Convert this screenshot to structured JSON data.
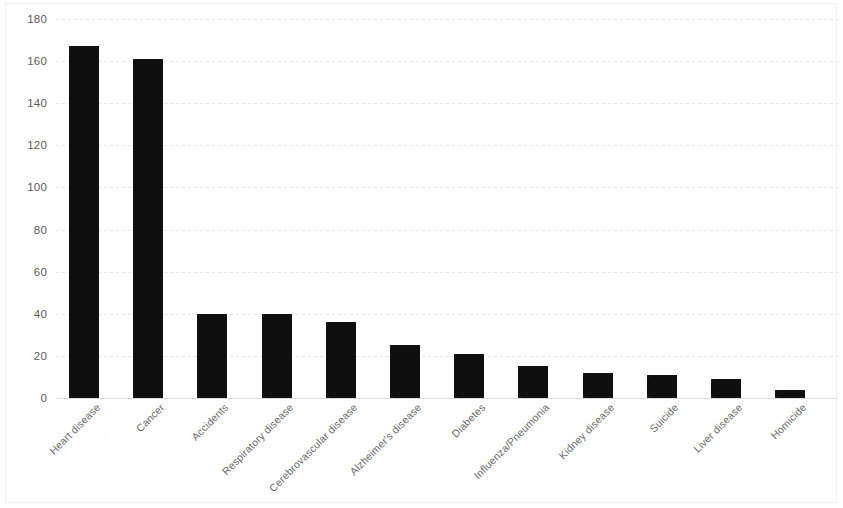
{
  "chart_data": {
    "type": "bar",
    "title": "",
    "subtitle": "",
    "xlabel": "",
    "ylabel": "",
    "ylim": [
      0,
      180
    ],
    "ytick_step": 20,
    "yticks": [
      "180",
      "160",
      "140",
      "120",
      "100",
      "80",
      "60",
      "40",
      "20",
      "0"
    ],
    "grid": true,
    "legend": "none",
    "bar_color": "#100f0f",
    "categories": [
      "Heart disease",
      "Cancer",
      "Accidents",
      "Respiratory disease",
      "Cerebrovascular disease",
      "Alzheimer's disease",
      "Diabetes",
      "Influenza/Pneumonia",
      "Kidney disease",
      "Suicide",
      "Liver disease",
      "Homicide"
    ],
    "values": [
      167,
      161,
      40,
      40,
      36,
      25,
      21,
      15,
      12,
      11,
      9,
      4
    ]
  }
}
